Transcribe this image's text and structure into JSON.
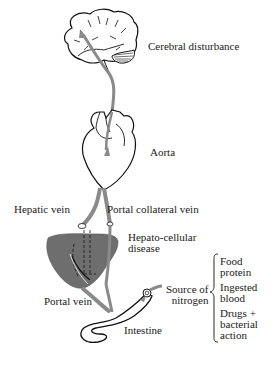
{
  "diagram": {
    "title": "",
    "organs": [
      "brain",
      "heart",
      "liver",
      "intestine"
    ],
    "labels": {
      "cerebral": "Cerebral disturbance",
      "aorta": "Aorta",
      "hepatic_vein": "Hepatic vein",
      "portal_collateral": "Portal collateral vein",
      "hepato_line1": "Hepato-cellular",
      "hepato_line2": "disease",
      "portal_vein": "Portal vein",
      "intestine": "Intestine",
      "source_line1": "Source of",
      "source_line2": "nitrogen"
    },
    "sources": [
      {
        "line1": "Food",
        "line2": "protein"
      },
      {
        "line1": "Ingested",
        "line2": "blood"
      },
      {
        "line1": "Drugs +",
        "line2": "bacterial",
        "line3": "action"
      }
    ],
    "colors": {
      "vessel": "#8a8a8a",
      "liver": "#6e6e6e",
      "outline": "#111111",
      "text": "#1a1a1a"
    }
  }
}
